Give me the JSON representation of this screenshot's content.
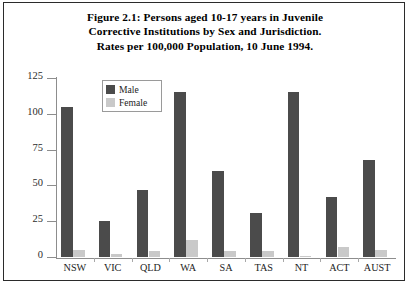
{
  "figure": {
    "title_lines": [
      "Figure 2.1: Persons aged 10-17 years in Juvenile",
      "Corrective Institutions by Sex and Jurisdiction.",
      "Rates per 100,000 Population, 10 June 1994."
    ]
  },
  "legend": {
    "male_label": "Male",
    "female_label": "Female"
  },
  "colors": {
    "male": "#4b4b4b",
    "female": "#c9c9c9",
    "axis": "#8d8d8d",
    "frame": "#2b2b2b",
    "text": "#111111"
  },
  "chart_data": {
    "type": "bar",
    "title": "Figure 2.1: Persons aged 10-17 years in Juvenile Corrective Institutions by Sex and Jurisdiction. Rates per 100,000 Population, 10 June 1994.",
    "xlabel": "",
    "ylabel": "",
    "ylim": [
      0,
      125
    ],
    "yticks": [
      0,
      25,
      50,
      75,
      100,
      125
    ],
    "ytick_labels": [
      "0",
      "25",
      "50",
      "75",
      "100",
      "125"
    ],
    "grid": false,
    "legend_position": "upper left inside axes",
    "categories": [
      "NSW",
      "VIC",
      "QLD",
      "WA",
      "SA",
      "TAS",
      "NT",
      "ACT",
      "AUST"
    ],
    "series": [
      {
        "name": "Male",
        "color": "#4b4b4b",
        "values": [
          105,
          25,
          47,
          115,
          60,
          31,
          115,
          42,
          68
        ]
      },
      {
        "name": "Female",
        "color": "#c9c9c9",
        "values": [
          5,
          2,
          4,
          12,
          4,
          4,
          1,
          7,
          5
        ]
      }
    ]
  }
}
